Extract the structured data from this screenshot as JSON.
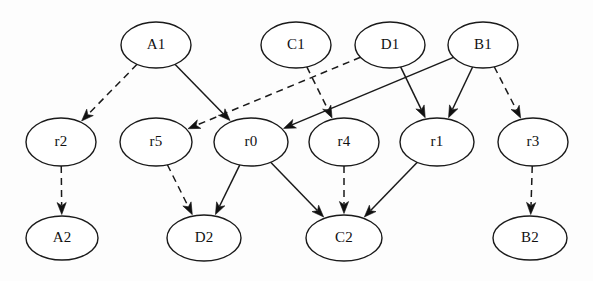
{
  "diagram": {
    "type": "directed-graph",
    "background_color": "#fdfdfd",
    "stroke_color": "#1a1a1a",
    "node_fill_color": "#ffffff",
    "nodes": [
      {
        "id": "A1",
        "label": "A1",
        "cx": 156,
        "cy": 45,
        "rx": 35,
        "ry": 23,
        "row": "top"
      },
      {
        "id": "C1",
        "label": "C1",
        "cx": 296,
        "cy": 45,
        "rx": 35,
        "ry": 23,
        "row": "top"
      },
      {
        "id": "D1",
        "label": "D1",
        "cx": 390,
        "cy": 45,
        "rx": 35,
        "ry": 23,
        "row": "top"
      },
      {
        "id": "B1",
        "label": "B1",
        "cx": 483,
        "cy": 45,
        "rx": 35,
        "ry": 23,
        "row": "top"
      },
      {
        "id": "r2",
        "label": "r2",
        "cx": 61,
        "cy": 142,
        "rx": 35,
        "ry": 24,
        "row": "middle"
      },
      {
        "id": "r5",
        "label": "r5",
        "cx": 156,
        "cy": 142,
        "rx": 36,
        "ry": 24,
        "row": "middle"
      },
      {
        "id": "r0",
        "label": "r0",
        "cx": 251,
        "cy": 142,
        "rx": 37,
        "ry": 24,
        "row": "middle"
      },
      {
        "id": "r4",
        "label": "r4",
        "cx": 344,
        "cy": 142,
        "rx": 35,
        "ry": 24,
        "row": "middle"
      },
      {
        "id": "r1",
        "label": "r1",
        "cx": 437,
        "cy": 142,
        "rx": 37,
        "ry": 24,
        "row": "middle"
      },
      {
        "id": "r3",
        "label": "r3",
        "cx": 533,
        "cy": 142,
        "rx": 35,
        "ry": 24,
        "row": "middle"
      },
      {
        "id": "A2",
        "label": "A2",
        "cx": 62,
        "cy": 238,
        "rx": 36,
        "ry": 22,
        "row": "bottom"
      },
      {
        "id": "D2",
        "label": "D2",
        "cx": 204,
        "cy": 238,
        "rx": 37,
        "ry": 23,
        "row": "bottom"
      },
      {
        "id": "C2",
        "label": "C2",
        "cx": 344,
        "cy": 238,
        "rx": 38,
        "ry": 23,
        "row": "bottom"
      },
      {
        "id": "B2",
        "label": "B2",
        "cx": 530,
        "cy": 238,
        "rx": 37,
        "ry": 22,
        "row": "bottom"
      }
    ],
    "edges": [
      {
        "id": "A1-r2",
        "from": "A1",
        "to": "r2",
        "style": "dashed",
        "arrow": true
      },
      {
        "id": "A1-r0",
        "from": "A1",
        "to": "r0",
        "style": "solid",
        "arrow": true
      },
      {
        "id": "C1-r4",
        "from": "C1",
        "to": "r4",
        "style": "dashed",
        "arrow": true
      },
      {
        "id": "D1-r5",
        "from": "D1",
        "to": "r5",
        "style": "dashed",
        "arrow": true
      },
      {
        "id": "D1-r1",
        "from": "D1",
        "to": "r1",
        "style": "solid",
        "arrow": true
      },
      {
        "id": "B1-r0",
        "from": "B1",
        "to": "r0",
        "style": "solid",
        "arrow": true
      },
      {
        "id": "B1-r1",
        "from": "B1",
        "to": "r1",
        "style": "solid",
        "arrow": true
      },
      {
        "id": "B1-r3",
        "from": "B1",
        "to": "r3",
        "style": "dashed",
        "arrow": true
      },
      {
        "id": "r2-A2",
        "from": "r2",
        "to": "A2",
        "style": "dashed",
        "arrow": true
      },
      {
        "id": "r5-D2",
        "from": "r5",
        "to": "D2",
        "style": "dashed",
        "arrow": true
      },
      {
        "id": "r0-D2",
        "from": "r0",
        "to": "D2",
        "style": "solid",
        "arrow": true
      },
      {
        "id": "r0-C2",
        "from": "r0",
        "to": "C2",
        "style": "solid",
        "arrow": true
      },
      {
        "id": "r4-C2",
        "from": "r4",
        "to": "C2",
        "style": "dashed",
        "arrow": true
      },
      {
        "id": "r1-C2",
        "from": "r1",
        "to": "C2",
        "style": "solid",
        "arrow": true
      },
      {
        "id": "r3-B2",
        "from": "r3",
        "to": "B2",
        "style": "dashed",
        "arrow": true
      }
    ]
  }
}
